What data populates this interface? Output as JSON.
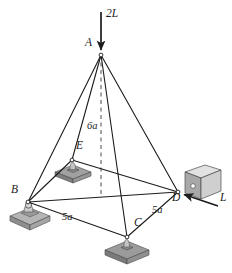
{
  "figure": {
    "background_color": "#ffffff",
    "line_color": "#1c1c1c",
    "support_fill": "#9a9a9a",
    "support_top": "#8c8c8c",
    "support_side": "#bdbdbd",
    "block_front": "#a8a8a8",
    "block_top": "#e2e2e2",
    "block_side": "#cfcfcf",
    "width": 232,
    "height": 273
  },
  "nodes": [
    {
      "id": "A",
      "label": "A",
      "x": 101,
      "y": 55,
      "label_x": 85,
      "label_y": 43,
      "support": "none"
    },
    {
      "id": "B",
      "label": "B",
      "x": 28,
      "y": 202,
      "label_x": 12,
      "label_y": 190,
      "support": "ball-socket"
    },
    {
      "id": "C",
      "label": "C",
      "x": 127,
      "y": 237,
      "label_x": 134,
      "label_y": 224,
      "support": "flat-pad"
    },
    {
      "id": "D",
      "label": "D",
      "x": 178,
      "y": 192,
      "label_x": 173,
      "label_y": 196,
      "support": "block"
    },
    {
      "id": "E",
      "label": "E",
      "x": 72,
      "y": 160,
      "label_x": 76,
      "label_y": 146,
      "support": "flat-pad"
    }
  ],
  "members": [
    {
      "from": "A",
      "to": "B"
    },
    {
      "from": "A",
      "to": "C"
    },
    {
      "from": "A",
      "to": "D"
    },
    {
      "from": "A",
      "to": "E"
    },
    {
      "from": "B",
      "to": "C"
    },
    {
      "from": "B",
      "to": "D"
    },
    {
      "from": "B",
      "to": "E"
    },
    {
      "from": "C",
      "to": "D"
    },
    {
      "from": "E",
      "to": "D"
    }
  ],
  "height_line": {
    "label": "6a",
    "style": "dashed",
    "from_x": 101,
    "from_y": 55,
    "to_x": 101,
    "to_y": 198,
    "label_x": 87,
    "label_y": 127
  },
  "dimensions": [
    {
      "label": "5a",
      "between": [
        "B",
        "C"
      ],
      "x": 62,
      "y": 218
    },
    {
      "label": "5a",
      "between": [
        "C",
        "D"
      ],
      "x": 152,
      "y": 211
    }
  ],
  "loads": [
    {
      "label": "2L",
      "direction": "down",
      "applied_at": "A",
      "tail_x": 101,
      "tail_y": 12,
      "head_x": 101,
      "head_y": 52,
      "label_x": 106,
      "label_y": 14
    },
    {
      "label": "L",
      "direction": "left",
      "applied_at": "D",
      "tail_x": 218,
      "tail_y": 206,
      "head_x": 183,
      "head_y": 194,
      "label_x": 220,
      "label_y": 198
    }
  ]
}
